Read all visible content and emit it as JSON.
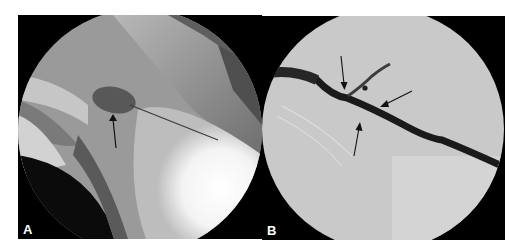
{
  "figure": {
    "panels": [
      {
        "label": "A",
        "description": "fluoroscopic image with contrast-filled collection and arrow"
      },
      {
        "label": "B",
        "description": "subtracted angiographic image of vessel with three arrows"
      }
    ]
  }
}
